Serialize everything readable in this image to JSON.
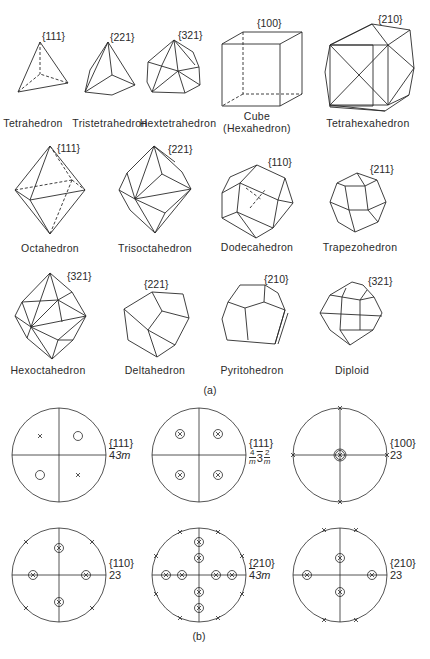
{
  "figure": {
    "part_a_label": "(a)",
    "part_b_label": "(b)",
    "forms": [
      {
        "name": "Tetrahedron",
        "index": "{111}"
      },
      {
        "name": "Tristetrahedron",
        "index": "{221}"
      },
      {
        "name": "Hextetrahedron",
        "index": "{321}"
      },
      {
        "name": "Cube",
        "name2": "(Hexahedron)",
        "index": "{100}"
      },
      {
        "name": "Tetrahexahedron",
        "index": "{210}"
      },
      {
        "name": "Octahedron",
        "index": "{111}"
      },
      {
        "name": "Trisoctahedron",
        "index": "{221}"
      },
      {
        "name": "Dodecahedron",
        "index": "{110}"
      },
      {
        "name": "Trapezohedron",
        "index": "{211}"
      },
      {
        "name": "Hexoctahedron",
        "index": "{321}"
      },
      {
        "name": "Deltahedron",
        "index": "{221}"
      },
      {
        "name": "Pyritohedron",
        "index": "{210}"
      },
      {
        "name": "Diploid",
        "index": "{321}"
      }
    ],
    "stereograms": [
      {
        "form": "{111}",
        "symmetry": "43m",
        "symmetry_bar": "4",
        "symmetry_rest": "3m",
        "poles": "2 crosses, 2 circles"
      },
      {
        "form": "{111}",
        "symmetry_parts": [
          "4/m",
          "3",
          "2/m"
        ],
        "num_4": "4",
        "num_3": "3",
        "num_2": "2",
        "den": "m",
        "poles": "4 circled crosses"
      },
      {
        "form": "{100}",
        "symmetry": "23",
        "poles": "1 center circled cross, 4 rim crosses"
      },
      {
        "form": "{110}",
        "symmetry": "23",
        "poles": "4 circled crosses, 4 rim crosses"
      },
      {
        "form": "{210}",
        "symmetry_bar": "4",
        "symmetry_rest": "3m",
        "poles": "8 circled crosses, 8 rim crosses"
      },
      {
        "form": "{210}",
        "symmetry": "23",
        "poles": "4 circled crosses, 4 rim crosses"
      }
    ]
  }
}
